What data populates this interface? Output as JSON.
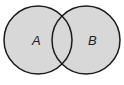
{
  "diagram": {
    "type": "venn",
    "sets": [
      {
        "id": "A",
        "label": "A",
        "cx": 38,
        "cy": 40,
        "r": 34
      },
      {
        "id": "B",
        "label": "B",
        "cx": 86,
        "cy": 40,
        "r": 34
      }
    ],
    "colors": {
      "fill": "#d8d8d8",
      "stroke": "#1a1a1a",
      "background": "#ffffff"
    }
  }
}
